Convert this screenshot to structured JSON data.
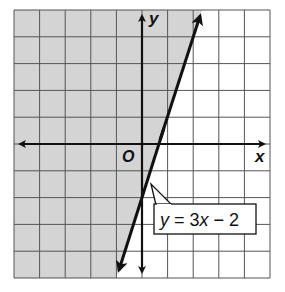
{
  "chart_data": {
    "type": "line",
    "title": "",
    "xlabel": "x",
    "ylabel": "y",
    "origin_label": "O",
    "xlim": [
      -5,
      5
    ],
    "ylim": [
      -5,
      5
    ],
    "grid": true,
    "grid_step": 1,
    "series": [
      {
        "name": "y = 3x − 2",
        "equation": "y = 3x - 2",
        "slope": 3,
        "intercept": -2,
        "line_style": "solid",
        "points": [
          [
            -1,
            -5
          ],
          [
            0,
            -2
          ],
          [
            0.667,
            0
          ],
          [
            1,
            1
          ],
          [
            2.333,
            5
          ]
        ]
      }
    ],
    "shaded_region": {
      "description": "region left of / above the line",
      "inequality": "y >= 3x - 2",
      "color": "#d4d4d4"
    },
    "annotations": [
      {
        "text": "y = 3x − 2",
        "points_to": [
          0.3,
          -1.1
        ]
      }
    ]
  },
  "colors": {
    "shade": "#d4d4d4",
    "grid": "#555555",
    "axis": "#111111",
    "line": "#111111",
    "background": "#ffffff"
  },
  "labels": {
    "x_axis": "x",
    "y_axis": "y",
    "origin": "O",
    "equation_prefix": "y",
    "equation_eq": " = 3",
    "equation_var": "x",
    "equation_rest": " − 2"
  }
}
